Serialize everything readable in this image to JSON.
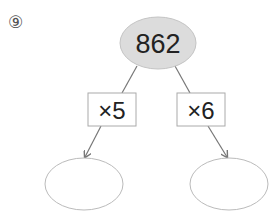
{
  "problem": {
    "number": "⑨"
  },
  "diagram": {
    "root": {
      "value": "862",
      "fill": "#dcdcdc",
      "stroke": "#c4c4c4"
    },
    "operations": [
      {
        "label": "×5"
      },
      {
        "label": "×6"
      }
    ],
    "results": [
      {
        "value": ""
      },
      {
        "value": ""
      }
    ],
    "colors": {
      "line": "#777777",
      "box_stroke": "#aaaaaa",
      "result_stroke": "#bbbbbb"
    }
  }
}
